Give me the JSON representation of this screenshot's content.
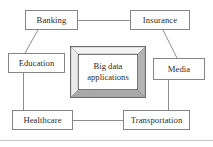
{
  "diagram": {
    "center": {
      "name": "big-data-applications",
      "line1": "Big data",
      "line2": "applications",
      "full_label": "Big data applications"
    },
    "nodes": [
      {
        "id": "banking",
        "label": "Banking"
      },
      {
        "id": "insurance",
        "label": "Insurance"
      },
      {
        "id": "education",
        "label": "Education"
      },
      {
        "id": "media",
        "label": "Media"
      },
      {
        "id": "healthcare",
        "label": "Healthcare"
      },
      {
        "id": "transportation",
        "label": "Transportation"
      }
    ],
    "connections": [
      {
        "from": "banking",
        "to": "insurance",
        "style": "horizontal"
      },
      {
        "from": "banking",
        "to": "education",
        "style": "diagonal"
      },
      {
        "from": "insurance",
        "to": "media",
        "style": "diagonal"
      },
      {
        "from": "education",
        "to": "healthcare",
        "style": "vertical"
      },
      {
        "from": "media",
        "to": "transportation",
        "style": "vertical"
      },
      {
        "from": "healthcare",
        "to": "transportation",
        "style": "horizontal"
      }
    ],
    "colors": {
      "background": "#ffffff",
      "box_border": "#868686",
      "text": "#2c2c2c",
      "connector": "#8d8d8d",
      "bevel_light": "#f2f2f2",
      "bevel_mid": "#d3d3d3",
      "bevel_dark": "#a7a7a7",
      "rule": "#c9c9c9"
    }
  }
}
